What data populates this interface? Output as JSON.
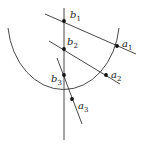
{
  "diagram": {
    "colors": {
      "stroke": "#333333",
      "point": "#111111",
      "background": "#ffffff"
    },
    "arc": {
      "start": [
        8,
        28
      ],
      "end": [
        119,
        28
      ],
      "center": [
        64,
        28
      ],
      "rx": 56,
      "ry": 71
    },
    "vertical_line": {
      "from": [
        64,
        8
      ],
      "to": [
        64,
        140
      ]
    },
    "lines": [
      {
        "name": "line-1",
        "from": [
          45,
          14
        ],
        "to": [
          136,
          54
        ]
      },
      {
        "name": "line-2",
        "from": [
          49,
          41
        ],
        "to": [
          120,
          84
        ]
      },
      {
        "name": "line-3",
        "from": [
          57,
          58
        ],
        "to": [
          82,
          124
        ]
      }
    ],
    "points": [
      {
        "id": "b1",
        "base": "b",
        "sub": "1",
        "x": 64,
        "y": 21,
        "lx": 70,
        "ly": 18
      },
      {
        "id": "b2",
        "base": "b",
        "sub": "2",
        "x": 64,
        "y": 49,
        "lx": 67,
        "ly": 45
      },
      {
        "id": "b3",
        "base": "b",
        "sub": "3",
        "x": 64,
        "y": 75,
        "lx": 51,
        "ly": 82
      },
      {
        "id": "a1",
        "base": "a",
        "sub": "1",
        "x": 117,
        "y": 46,
        "lx": 122,
        "ly": 47
      },
      {
        "id": "a2",
        "base": "a",
        "sub": "2",
        "x": 106,
        "y": 75,
        "lx": 111,
        "ly": 78
      },
      {
        "id": "a3",
        "base": "a",
        "sub": "3",
        "x": 72,
        "y": 99,
        "lx": 78,
        "ly": 109
      }
    ]
  }
}
